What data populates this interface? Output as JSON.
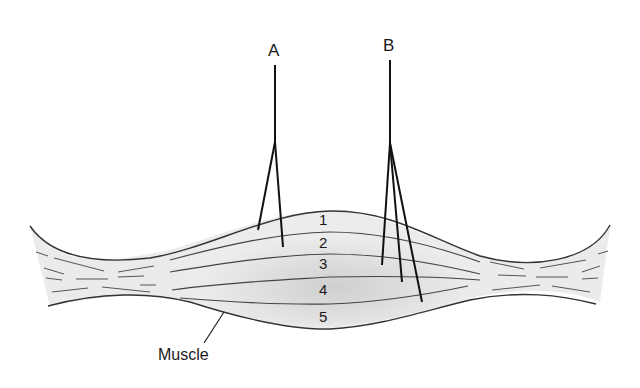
{
  "diagram": {
    "type": "muscle cross-section with recording electrodes",
    "electrodes": [
      {
        "id": "A",
        "label": "A",
        "tips": 2
      },
      {
        "id": "B",
        "label": "B",
        "tips": 3
      }
    ],
    "layers": [
      {
        "label": "1"
      },
      {
        "label": "2"
      },
      {
        "label": "3"
      },
      {
        "label": "4"
      },
      {
        "label": "5"
      }
    ],
    "muscle_label": "Muscle",
    "colors": {
      "outline": "#333333",
      "fill": "#e8e8e8",
      "fill_center": "#cfcfcf",
      "electrode": "#111111",
      "fiber": "#555555"
    }
  }
}
